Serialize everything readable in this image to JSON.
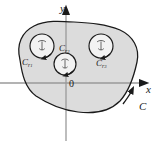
{
  "figure": {
    "background_color": "#ffffff",
    "region_fill_color": "#dcdcdc",
    "curve_color": "#1a1a1a",
    "axis_color": "#9a9a9a"
  },
  "axes": {
    "x_label": "x",
    "y_label": "y",
    "origin_label": "0",
    "origin_px": {
      "x": 66,
      "y": 83
    },
    "x_axis": {
      "from_px": 0,
      "to_px": 147,
      "arrow": "right"
    },
    "y_axis": {
      "from_px": 141,
      "to_px": 8,
      "arrow": "up"
    }
  },
  "contours": {
    "outer": {
      "name": "C",
      "label": "C",
      "orientation": "counterclockwise",
      "arrow_label_position": "lower-right"
    },
    "inner": [
      {
        "name": "Cr1",
        "label_base": "C",
        "label_sub": "r",
        "label_subnum": "1",
        "orientation": "clockwise",
        "center_px": {
          "x": 42,
          "y": 46
        },
        "radius_px": 12
      },
      {
        "name": "Cr2",
        "label_base": "C",
        "label_sub": "r",
        "label_subnum": "2",
        "orientation": "clockwise",
        "center_px": {
          "x": 65,
          "y": 64
        },
        "radius_px": 11
      },
      {
        "name": "Cr3",
        "label_base": "C",
        "label_sub": "r",
        "label_subnum": "3",
        "orientation": "clockwise",
        "center_px": {
          "x": 101,
          "y": 46
        },
        "radius_px": 12
      }
    ]
  }
}
